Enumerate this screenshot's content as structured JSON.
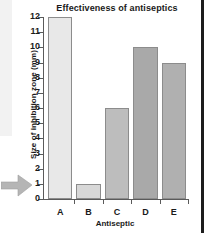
{
  "chart_data": {
    "type": "bar",
    "title": "Effectiveness of antiseptics",
    "xlabel": "Antiseptic",
    "ylabel": "Size of inhibition zone (mm)",
    "categories": [
      "A",
      "B",
      "C",
      "D",
      "E"
    ],
    "values": [
      12,
      1,
      6,
      10,
      9
    ],
    "ylim": [
      0,
      12
    ],
    "yticks": [
      0,
      1,
      2,
      3,
      4,
      5,
      6,
      7,
      8,
      9,
      10,
      11,
      12
    ],
    "ytick_labels": [
      "0",
      "1",
      "2",
      "3",
      "4",
      "5",
      "6",
      "7",
      "8",
      "9",
      "10",
      "11",
      "12"
    ],
    "grid": false,
    "legend": false,
    "bar_colors": [
      "#e8e8e8",
      "#d8d8d8",
      "#bdbdbd",
      "#a9a9a9",
      "#b0b0b0"
    ],
    "bar_edge_color": "#8c8c8c",
    "axis_color": "#5a5a5a",
    "text_color": "#1a1a1a",
    "background": "#ffffff"
  },
  "annotations": {
    "pointer_arrow": "arrow-right-icon",
    "page_rule_color": "#1d1d1d"
  }
}
